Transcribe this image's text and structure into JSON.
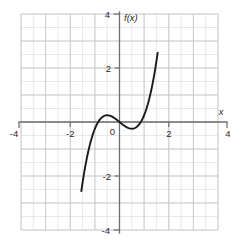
{
  "chart_data": {
    "type": "line",
    "title": "",
    "subtitle": "",
    "xlabel": "x",
    "ylabel": "f(x)",
    "function_label": "f(x)",
    "expression": "f(x) = x^3 - 0.75x",
    "xlim": [
      -4,
      4
    ],
    "ylim": [
      -4,
      4
    ],
    "grid": true,
    "grid_major_step": 1,
    "grid_minor_step": 0.5,
    "legend": "none",
    "x_tick_labels": [
      "-4",
      "-2",
      "2",
      "4"
    ],
    "x_tick_values": [
      -4,
      -2,
      2,
      4
    ],
    "y_tick_labels": [
      "4",
      "2",
      "0",
      "-2",
      "-4"
    ],
    "y_tick_values": [
      4,
      2,
      0,
      -2,
      -4
    ],
    "origin_label": "0",
    "series": [
      {
        "name": "f(x)",
        "color": "#1a1a1a",
        "x": [
          -1.55,
          -1.5,
          -1.45,
          -1.4,
          -1.35,
          -1.3,
          -1.25,
          -1.2,
          -1.15,
          -1.1,
          -1.05,
          -1.0,
          -0.95,
          -0.9,
          -0.85,
          -0.8,
          -0.75,
          -0.7,
          -0.65,
          -0.6,
          -0.55,
          -0.5,
          -0.45,
          -0.4,
          -0.35,
          -0.3,
          -0.25,
          -0.2,
          -0.15,
          -0.1,
          -0.05,
          0.0,
          0.05,
          0.1,
          0.15,
          0.2,
          0.25,
          0.3,
          0.35,
          0.4,
          0.45,
          0.5,
          0.55,
          0.6,
          0.65,
          0.7,
          0.75,
          0.8,
          0.85,
          0.9,
          0.95,
          1.0,
          1.05,
          1.1,
          1.15,
          1.2,
          1.25,
          1.3,
          1.35,
          1.4,
          1.45,
          1.5,
          1.55
        ],
        "y": [
          -2.562,
          -2.25,
          -1.961,
          -1.694,
          -1.449,
          -1.222,
          -1.016,
          -0.828,
          -0.658,
          -0.506,
          -0.371,
          -0.25,
          -0.145,
          -0.054,
          0.024,
          0.088,
          0.141,
          0.182,
          0.213,
          0.234,
          0.246,
          0.25,
          0.246,
          0.236,
          0.22,
          0.198,
          0.172,
          0.142,
          0.109,
          0.074,
          0.037,
          0.0,
          -0.037,
          -0.074,
          -0.109,
          -0.142,
          -0.172,
          -0.198,
          -0.22,
          -0.236,
          -0.246,
          -0.25,
          -0.246,
          -0.234,
          -0.213,
          -0.182,
          -0.141,
          -0.088,
          -0.024,
          0.054,
          0.145,
          0.25,
          0.371,
          0.506,
          0.658,
          0.828,
          1.016,
          1.222,
          1.449,
          1.694,
          1.961,
          2.25,
          2.562
        ],
        "roots": [
          -0.866,
          0,
          0.866
        ],
        "local_max": {
          "x": -0.5,
          "y": 0.25
        },
        "local_min": {
          "x": 0.5,
          "y": -0.25
        }
      }
    ],
    "colors": {
      "curve": "#1a1a1a",
      "axis": "#6e6e6e",
      "grid_major": "#c4c4c4",
      "grid_minor": "#dedede",
      "text": "#2b2b2b",
      "background": "#ffffff"
    }
  }
}
